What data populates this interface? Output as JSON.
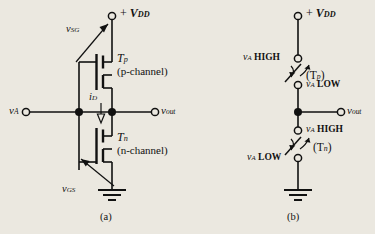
{
  "figure": {
    "background_color": "#ebe8e0",
    "ink_color": "#111111",
    "panels": [
      {
        "caption": "(a)",
        "title": "CMOS inverter transistor schematic"
      },
      {
        "caption": "(b)",
        "title": "Switch equivalent model"
      }
    ]
  },
  "panel_a": {
    "caption": "(a)",
    "supply": {
      "sign": "+",
      "symbol": "V",
      "sub": "DD",
      "node": "open-terminal"
    },
    "input": {
      "symbol": "v",
      "sub": "A",
      "node": "open-terminal"
    },
    "output": {
      "symbol": "v",
      "sub": "out",
      "node": "open-terminal"
    },
    "v_sg": {
      "symbol": "v",
      "sub": "SG"
    },
    "v_gs": {
      "symbol": "v",
      "sub": "GS"
    },
    "i_d": {
      "symbol": "i",
      "sub": "D"
    },
    "transistor_p": {
      "name": "T",
      "sub": "p",
      "channel": "(p-channel)"
    },
    "transistor_n": {
      "name": "T",
      "sub": "n",
      "channel": "(n-channel)"
    },
    "ground": "ground-symbol"
  },
  "panel_b": {
    "caption": "(b)",
    "supply": {
      "sign": "+",
      "symbol": "V",
      "sub": "DD",
      "node": "open-terminal"
    },
    "output": {
      "symbol": "v",
      "sub": "out",
      "node": "open-terminal"
    },
    "switch_p": {
      "label": "(T",
      "label_sub": "p",
      "label_close": ")",
      "terminal_top": {
        "symbol": "v",
        "sub": "A",
        "state": "HIGH"
      },
      "terminal_bottom": {
        "symbol": "v",
        "sub": "A",
        "state": "LOW"
      }
    },
    "switch_n": {
      "label": "(T",
      "label_sub": "n",
      "label_close": ")",
      "terminal_top": {
        "symbol": "v",
        "sub": "A",
        "state": "HIGH"
      },
      "terminal_bottom": {
        "symbol": "v",
        "sub": "A",
        "state": "LOW"
      }
    },
    "ground": "ground-symbol"
  }
}
